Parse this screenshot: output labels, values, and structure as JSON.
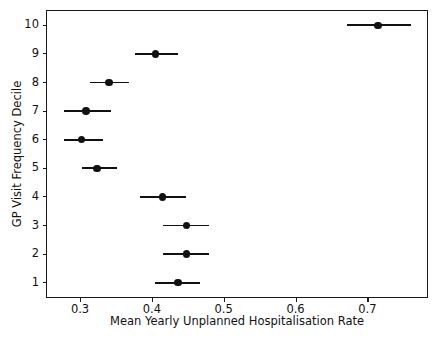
{
  "chart_data": {
    "type": "scatter",
    "title": "",
    "xlabel": "Mean Yearly Unplanned Hospitalisation Rate",
    "ylabel": "GP Visit Frequency Decile",
    "xlim": [
      0.254,
      0.783
    ],
    "ylim": [
      0.5,
      10.5
    ],
    "grid": false,
    "legend": null,
    "xticks": [
      0.3,
      0.4,
      0.5,
      0.6,
      0.7
    ],
    "xtick_labels": [
      "0.3",
      "0.4",
      "0.5",
      "0.6",
      "0.7"
    ],
    "yticks": [
      1,
      2,
      3,
      4,
      5,
      6,
      7,
      8,
      9,
      10
    ],
    "ytick_labels": [
      "1",
      "2",
      "3",
      "4",
      "5",
      "6",
      "7",
      "8",
      "9",
      "10"
    ],
    "marker_color": "#111111",
    "errorbar_color": "#111111",
    "categories": [
      1,
      2,
      3,
      4,
      5,
      6,
      7,
      8,
      9,
      10
    ],
    "values": [
      0.436,
      0.448,
      0.448,
      0.415,
      0.324,
      0.302,
      0.308,
      0.34,
      0.405,
      0.715
    ],
    "points": [
      {
        "decile": 1,
        "mean": 0.436,
        "ci_low": 0.405,
        "ci_high": 0.467
      },
      {
        "decile": 2,
        "mean": 0.448,
        "ci_low": 0.416,
        "ci_high": 0.479
      },
      {
        "decile": 3,
        "mean": 0.448,
        "ci_low": 0.416,
        "ci_high": 0.479
      },
      {
        "decile": 4,
        "mean": 0.415,
        "ci_low": 0.384,
        "ci_high": 0.447
      },
      {
        "decile": 5,
        "mean": 0.324,
        "ci_low": 0.303,
        "ci_high": 0.351
      },
      {
        "decile": 6,
        "mean": 0.302,
        "ci_low": 0.277,
        "ci_high": 0.332
      },
      {
        "decile": 7,
        "mean": 0.308,
        "ci_low": 0.278,
        "ci_high": 0.343
      },
      {
        "decile": 8,
        "mean": 0.34,
        "ci_low": 0.314,
        "ci_high": 0.368
      },
      {
        "decile": 9,
        "mean": 0.405,
        "ci_low": 0.377,
        "ci_high": 0.436
      },
      {
        "decile": 10,
        "mean": 0.715,
        "ci_low": 0.671,
        "ci_high": 0.761
      }
    ]
  }
}
